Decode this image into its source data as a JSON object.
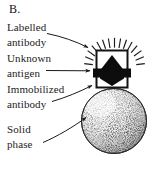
{
  "figure": {
    "panel_letter": "B.",
    "background_color": "#ffffff",
    "ink_color": "#1a1a1a"
  },
  "callouts": [
    {
      "name": "labelled-antibody",
      "lines": [
        "Labelled",
        "antibody"
      ],
      "leader": "curved-arrow-to-sunburst"
    },
    {
      "name": "unknown-antigen",
      "lines": [
        "Unknown",
        "antigen"
      ],
      "leader": "straight-arrow-to-black-antigen"
    },
    {
      "name": "immobilized-antibody",
      "lines": [
        "Immobilized",
        "antibody"
      ],
      "leader": "arrow-to-lower-box-wall"
    },
    {
      "name": "solid-phase",
      "lines": [
        "Solid",
        "phase"
      ],
      "leader": "arrow-to-sphere"
    }
  ],
  "diagram": {
    "sunburst": {
      "name": "labelled-antibody-signal",
      "ray_count": 13,
      "color": "#1a1a1a"
    },
    "box": {
      "name": "antibody-capture-box",
      "stroke": "#141414",
      "fill": "#ffffff"
    },
    "antigen": {
      "name": "unknown-antigen-shape",
      "fill": "#0d0d0d",
      "shape": "double-arrowhead-diamond"
    },
    "sphere": {
      "name": "solid-phase-bead",
      "stroke": "#2a2a2a",
      "texture": "stipple",
      "shading": "light-top-left-dark-bottom-right"
    }
  }
}
